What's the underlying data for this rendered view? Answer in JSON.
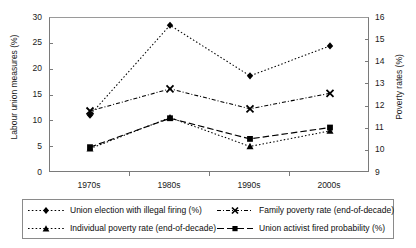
{
  "chart_data": {
    "type": "line",
    "title": "",
    "categories": [
      "1970s",
      "1980s",
      "1990s",
      "2000s"
    ],
    "xlabel": "",
    "ylabel": "Labour union measures (%)",
    "ylabel_secondary": "Poverty rates (%)",
    "ylim": [
      0,
      30
    ],
    "ylim_secondary": [
      9,
      16
    ],
    "yticks": [
      "0",
      "5",
      "10",
      "15",
      "20",
      "25",
      "30"
    ],
    "yticks_secondary": [
      "9",
      "10",
      "11",
      "12",
      "13",
      "14",
      "15",
      "16"
    ],
    "grid": false,
    "legend_position": "bottom",
    "series": [
      {
        "name": "Union election with illegal firing (%)",
        "axis": "left",
        "marker": "diamond",
        "line_style": "dotted",
        "color": "#000000",
        "values": [
          11.2,
          28.6,
          18.8,
          24.6
        ]
      },
      {
        "name": "Individual poverty rate (end-of-decade)",
        "axis": "right",
        "marker": "triangle",
        "line_style": "dotted",
        "color": "#000000",
        "values": [
          10.1,
          11.5,
          10.2,
          10.9
        ]
      },
      {
        "name": "Family poverty rate (end-of-decade)",
        "axis": "right",
        "marker": "x",
        "line_style": "dash-dot",
        "color": "#000000",
        "values": [
          11.8,
          12.8,
          11.9,
          12.6
        ]
      },
      {
        "name": "Union activist fired probability (%)",
        "axis": "left",
        "marker": "square",
        "line_style": "dashed",
        "color": "#000000",
        "values": [
          5.0,
          10.6,
          6.6,
          8.8
        ]
      }
    ]
  },
  "axes": {
    "left_title": "Labour union measures (%)",
    "right_title": "Poverty rates (%)",
    "left_ticks": [
      "30",
      "25",
      "20",
      "15",
      "10",
      "5",
      "0"
    ],
    "right_ticks": [
      "16",
      "15",
      "14",
      "13",
      "12",
      "11",
      "10",
      "9"
    ],
    "x_ticks": [
      "1970s",
      "1980s",
      "1990s",
      "2000s"
    ]
  },
  "legend": {
    "items": [
      {
        "label": "Union election with illegal firing (%)",
        "key": "diamond-dotted-key"
      },
      {
        "label": "Family poverty rate (end-of-decade)",
        "key": "x-dashdot-key"
      },
      {
        "label": "Individual poverty rate (end-of-decade)",
        "key": "triangle-dotted-key"
      },
      {
        "label": "Union activist fired probability (%)",
        "key": "square-dashed-key"
      }
    ]
  }
}
